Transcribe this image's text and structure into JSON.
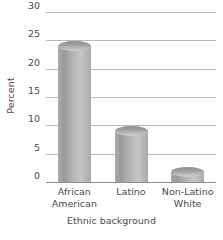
{
  "chart_data": {
    "type": "bar",
    "title": "",
    "categories": [
      "African American",
      "Latino",
      "Non-Latino White"
    ],
    "category_lines": [
      [
        "African",
        "American"
      ],
      [
        "Latino"
      ],
      [
        "Non-Latino",
        "White"
      ]
    ],
    "values": [
      24,
      9,
      1.7
    ],
    "xlabel": "Ethnic background",
    "ylabel": "Percent",
    "ylim": [
      0,
      30
    ],
    "yticks": [
      30,
      25,
      20,
      15,
      10,
      5,
      0
    ],
    "ytick_labels": [
      "30",
      "25",
      "20",
      "15",
      "10",
      "5",
      "0"
    ],
    "grid": true,
    "legend": "none",
    "colors": {
      "bar_light": "#c6c6c6",
      "bar_mid": "#b5b5b5",
      "bar_dark": "#9a9a9a",
      "gridline": "#b9b9b9",
      "axis": "#8e8e8e",
      "text": "#4a4a4a",
      "background": "#ffffff"
    }
  }
}
